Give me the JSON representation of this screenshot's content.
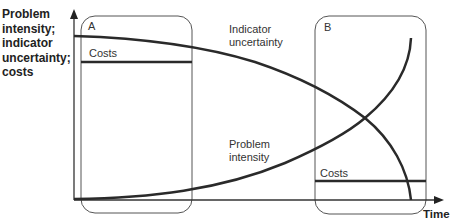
{
  "diagram": {
    "y_axis_label_lines": [
      "Problem",
      "intensity;",
      "indicator",
      "uncertainty;",
      "costs"
    ],
    "x_axis_label": "Time",
    "boxes": [
      {
        "id": "A",
        "label": "A",
        "costs_label": "Costs",
        "costs_level": "high"
      },
      {
        "id": "B",
        "label": "B",
        "costs_label": "Costs",
        "costs_level": "low"
      }
    ],
    "curves": [
      {
        "name": "Indicator uncertainty",
        "label_lines": [
          "Indicator",
          "uncertainty"
        ],
        "trend": "decreasing"
      },
      {
        "name": "Problem intensity",
        "label_lines": [
          "Problem",
          "intensity"
        ],
        "trend": "increasing"
      }
    ],
    "colors": {
      "curve": "#2a2a2a",
      "box_border": "#555555",
      "text": "#333333"
    }
  }
}
